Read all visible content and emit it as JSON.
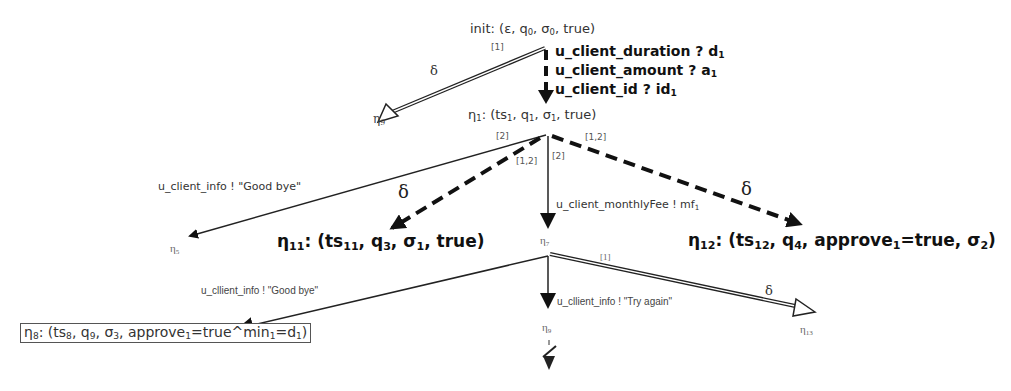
{
  "diagram": {
    "init": {
      "label": "init: (ε, q",
      "q_sub": "0",
      "sep1": ", σ",
      "s_sub": "0",
      "tail": ", true)"
    },
    "input_actions": [
      {
        "name": "u_client_duration ? d",
        "sub": "1"
      },
      {
        "name": "u_client_amount ? a",
        "sub": "1"
      },
      {
        "name": "u_client_id ? id",
        "sub": "1"
      }
    ],
    "eta1": {
      "eta": "η",
      "eta_sub": "1",
      "body": ": (ts",
      "ts_sub": "1",
      "q": ", q",
      "q_sub": "1",
      "s": ", σ",
      "s_sub": "1",
      "tail": ", true)"
    },
    "eta9_top": {
      "eta": "η",
      "sub": "9"
    },
    "eta5": {
      "eta": "η",
      "sub": "5"
    },
    "eta7": {
      "eta": "η",
      "sub": "7"
    },
    "eta9_bottom": {
      "eta": "η",
      "sub": "9"
    },
    "eta13": {
      "eta": "η",
      "sub": "13"
    },
    "eta11": {
      "eta": "η",
      "eta_sub": "11",
      "body": ": (ts",
      "ts_sub": "11",
      "q": ", q",
      "q_sub": "3",
      "s": ", σ",
      "s_sub": "1",
      "tail": ", true)"
    },
    "eta12": {
      "eta": "η",
      "eta_sub": "12",
      "body": ": (ts",
      "ts_sub": "12",
      "q": ", q",
      "q_sub": "4",
      "a": ", approve",
      "a_sub": "1",
      "a_tail": "=true, σ",
      "s_sub": "2",
      "tail": ")"
    },
    "eta8": {
      "eta": "η",
      "eta_sub": "8",
      "body": ": (ts",
      "ts_sub": "8",
      "q": ", q",
      "q_sub": "9",
      "s": ", σ",
      "s_sub": "3",
      "a": ", approve",
      "a_sub": "1",
      "m": "=true^min",
      "m_sub": "1",
      "d": "=d",
      "d_sub": "1",
      "tail": ")"
    },
    "edges": {
      "init_to_eta9": {
        "tag": "[1]",
        "label": "δ"
      },
      "eta1_to_eta5": {
        "tag": "[2]",
        "label": "u_client_info ! \"Good bye\""
      },
      "eta1_to_eta11": {
        "tag": "[1,2]",
        "label": "δ"
      },
      "eta1_to_eta7": {
        "tag": "[2]",
        "label": "u_client_monthlyFee ! mf",
        "label_sub": "1"
      },
      "eta1_to_eta12": {
        "tag": "[1,2]",
        "label": "δ"
      },
      "eta7_to_eta8": {
        "label": "u_cllient_info ! \"Good bye\""
      },
      "eta7_to_eta9": {
        "label": "u_cllient_info ! \"Try again\""
      },
      "eta7_to_eta13": {
        "tag": "[1]",
        "label": "δ"
      }
    },
    "terminal": {
      "symbol": "deadlock"
    }
  }
}
